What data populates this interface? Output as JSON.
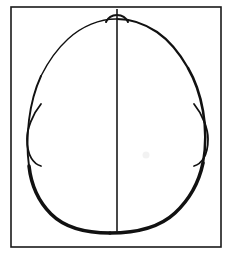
{
  "figure": {
    "title": "Head outline, vertex (top-down) view",
    "background_color": "#ffffff",
    "ink_color": "#111111",
    "artifact_color": "#f2f2f2"
  },
  "frame": {
    "name": "Rectangular border",
    "x": 11,
    "y": 7,
    "width": 210,
    "height": 240,
    "stroke_width": 1.6,
    "color": "#1a1a1a"
  },
  "midline": {
    "name": "Midsagittal line",
    "x": 117,
    "y_top": 9,
    "y_bottom": 232,
    "stroke_width": 1.6,
    "color": "#1a1a1a"
  },
  "skull_outline": {
    "name": "Cranial outline",
    "shape": "ovoid",
    "apex_y": 19,
    "base_y": 232,
    "left_extent_x": 28,
    "right_extent_x": 205,
    "widest_y": 165,
    "stroke_width_min": 1.4,
    "stroke_width_max": 3.6,
    "color": "#111111"
  },
  "nose": {
    "name": "Nasal prominence",
    "center_x": 117,
    "peak_y": 13,
    "base_y": 22,
    "half_width": 11,
    "stroke_width": 2.0,
    "color": "#111111"
  },
  "ears": [
    {
      "side": "left",
      "name": "Left auricle",
      "top_y": 104,
      "bottom_y": 166,
      "outer_x": 27,
      "inner_x": 41,
      "stroke_width": 1.8
    },
    {
      "side": "right",
      "name": "Right auricle",
      "top_y": 104,
      "bottom_y": 166,
      "outer_x": 208,
      "inner_x": 194,
      "stroke_width": 1.8
    }
  ],
  "artifacts": [
    {
      "name": "Scan speck",
      "x": 146,
      "y": 155,
      "radius": 3.5,
      "color": "#f2f2f2"
    }
  ]
}
